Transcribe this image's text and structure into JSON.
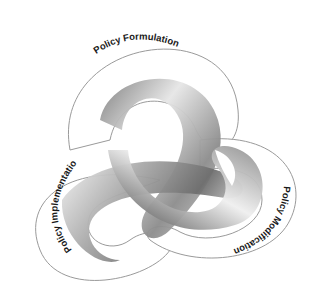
{
  "diagram": {
    "type": "trefoil-knot",
    "lobes": [
      {
        "id": "top",
        "label": "Policy Formulation"
      },
      {
        "id": "left",
        "label": "Policy Implementation"
      },
      {
        "id": "right",
        "label": "Policy Modification"
      }
    ],
    "colors": {
      "background": "#ffffff",
      "band_light": "#f4f4f4",
      "band_mid": "#b8b8b8",
      "band_dark": "#6e6e6e",
      "outline": "#9a9a9a",
      "text": "#1a1a1a"
    }
  }
}
